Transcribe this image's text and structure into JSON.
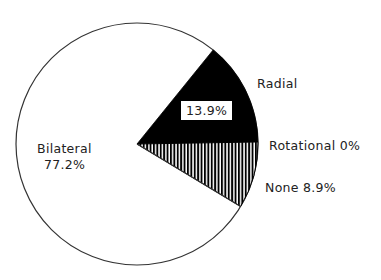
{
  "chart_data": {
    "type": "pie",
    "title": "",
    "slices": [
      {
        "label": "Radial",
        "value": 13.9,
        "display": "13.9%",
        "fill": "solid-black"
      },
      {
        "label": "Rotational",
        "value": 0,
        "display": "0%",
        "fill": "none"
      },
      {
        "label": "None",
        "value": 8.9,
        "display": "8.9%",
        "fill": "vertical-hatch"
      },
      {
        "label": "Bilateral",
        "value": 77.2,
        "display": "77.2%",
        "fill": "white"
      }
    ],
    "start_angle_deg": 39,
    "direction": "clockwise",
    "legend": "none (direct labels)"
  },
  "labels": {
    "radial_name": "Radial",
    "radial_pct": "13.9%",
    "rotational": "Rotational 0%",
    "none": "None 8.9%",
    "bilateral_name": "Bilateral",
    "bilateral_pct": "77.2%"
  },
  "colors": {
    "solid": "#000000",
    "hatch": "#000000",
    "background": "#ffffff",
    "outline": "#333333"
  }
}
